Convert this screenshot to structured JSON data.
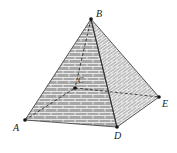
{
  "figure": {
    "vertices": {
      "A": {
        "label": "A",
        "x": 25,
        "y": 120
      },
      "B": {
        "label": "B",
        "x": 91,
        "y": 19
      },
      "C": {
        "label": "C",
        "x": 75,
        "y": 88
      },
      "D": {
        "label": "D",
        "x": 117,
        "y": 127
      },
      "E": {
        "label": "E",
        "x": 159,
        "y": 97
      }
    },
    "hidden_edges": [
      "A-C",
      "C-E",
      "B-C"
    ],
    "colors": {
      "left_face": "#a9a9a9",
      "right_face": "#bdbdbd",
      "edge": "#333333",
      "brick_line": "#f2f2f2"
    }
  }
}
